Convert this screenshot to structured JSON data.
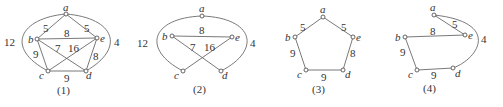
{
  "figures": [
    {
      "caption": "(1)",
      "vertices": [
        "a",
        "b",
        "c",
        "d",
        "e"
      ],
      "edges": [
        {
          "from": "a",
          "to": "b",
          "weight": "5"
        },
        {
          "from": "a",
          "to": "e",
          "weight": "5"
        },
        {
          "from": "b",
          "to": "e",
          "weight": "8"
        },
        {
          "from": "b",
          "to": "d",
          "weight": "7"
        },
        {
          "from": "c",
          "to": "e",
          "weight": "16"
        },
        {
          "from": "b",
          "to": "c",
          "weight": "9"
        },
        {
          "from": "e",
          "to": "d",
          "weight": "8"
        },
        {
          "from": "c",
          "to": "d",
          "weight": "9"
        },
        {
          "from": "a",
          "to": "c",
          "weight": "12",
          "curved": true
        },
        {
          "from": "a",
          "to": "d",
          "weight": "4",
          "curved": true
        }
      ]
    },
    {
      "caption": "(2)",
      "vertices": [
        "a",
        "b",
        "c",
        "d",
        "e"
      ],
      "edges": [
        {
          "from": "b",
          "to": "e",
          "weight": "8"
        },
        {
          "from": "b",
          "to": "d",
          "weight": "7"
        },
        {
          "from": "c",
          "to": "e",
          "weight": "16"
        },
        {
          "from": "a",
          "to": "c",
          "weight": "12",
          "curved": true
        },
        {
          "from": "a",
          "to": "d",
          "weight": "4",
          "curved": true
        }
      ]
    },
    {
      "caption": "(3)",
      "vertices": [
        "a",
        "b",
        "c",
        "d",
        "e"
      ],
      "edges": [
        {
          "from": "a",
          "to": "b",
          "weight": "5"
        },
        {
          "from": "a",
          "to": "e",
          "weight": "5"
        },
        {
          "from": "b",
          "to": "c",
          "weight": "9"
        },
        {
          "from": "e",
          "to": "d",
          "weight": "8"
        },
        {
          "from": "c",
          "to": "d",
          "weight": "9"
        }
      ]
    },
    {
      "caption": "(4)",
      "vertices": [
        "a",
        "b",
        "c",
        "d",
        "e"
      ],
      "edges": [
        {
          "from": "a",
          "to": "e",
          "weight": "5"
        },
        {
          "from": "b",
          "to": "e",
          "weight": "8"
        },
        {
          "from": "b",
          "to": "c",
          "weight": "9"
        },
        {
          "from": "c",
          "to": "d",
          "weight": "9"
        },
        {
          "from": "a",
          "to": "d",
          "weight": "4",
          "curved": true
        }
      ]
    }
  ]
}
